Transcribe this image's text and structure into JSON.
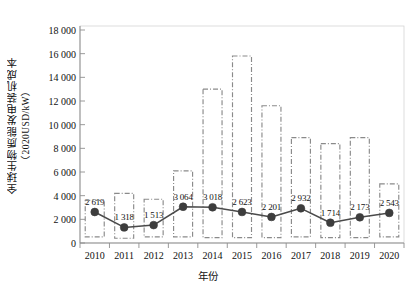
{
  "axes": {
    "y_title_main": "全球生物质能发电装机成本",
    "y_title_unit": "（2020USD/kW）",
    "x_title": "年份",
    "y_ticks": [
      "0",
      "2 000",
      "4 000",
      "6 000",
      "8 000",
      "10 000",
      "12 000",
      "14 000",
      "16 000",
      "18 000"
    ],
    "x_ticks": [
      "2010",
      "2011",
      "2012",
      "2013",
      "2014",
      "2015",
      "2016",
      "2017",
      "2018",
      "2019",
      "2020"
    ]
  },
  "chart_data": {
    "type": "line",
    "title": "",
    "xlabel": "年份",
    "ylabel": "全球生物质能发电装机成本（2020USD/kW）",
    "ylim": [
      0,
      18000
    ],
    "ytick_values": [
      0,
      2000,
      4000,
      6000,
      8000,
      10000,
      12000,
      14000,
      16000,
      18000
    ],
    "grid": false,
    "legend": "none",
    "categories": [
      "2010",
      "2011",
      "2012",
      "2013",
      "2014",
      "2015",
      "2016",
      "2017",
      "2018",
      "2019",
      "2020"
    ],
    "series": [
      {
        "name": "加权平均装机成本",
        "marker": "filled-circle",
        "color": "#4a4a4a",
        "values": [
          2619,
          1318,
          1513,
          3064,
          3018,
          2623,
          2201,
          2932,
          1714,
          2173,
          2543
        ],
        "point_labels": [
          "2 619",
          "1 318",
          "1 513",
          "3 064",
          "3 018",
          "2 623",
          "2 201",
          "2 932",
          "1 714",
          "2 173",
          "2 543"
        ]
      }
    ],
    "ranges": {
      "name": "成本区间（虚线框）",
      "style": "dash-dot rectangle",
      "color": "#8a8a8a",
      "low": [
        520,
        400,
        520,
        520,
        450,
        450,
        450,
        520,
        450,
        450,
        520
      ],
      "high": [
        3600,
        4200,
        3700,
        6100,
        13000,
        15800,
        11600,
        8900,
        8400,
        8900,
        5000
      ]
    }
  },
  "colors": {
    "line": "#4a4a4a",
    "marker": "#3d3d3d",
    "box": "#8a8a8a",
    "axis": "#9a9a9a",
    "text": "#111111"
  }
}
